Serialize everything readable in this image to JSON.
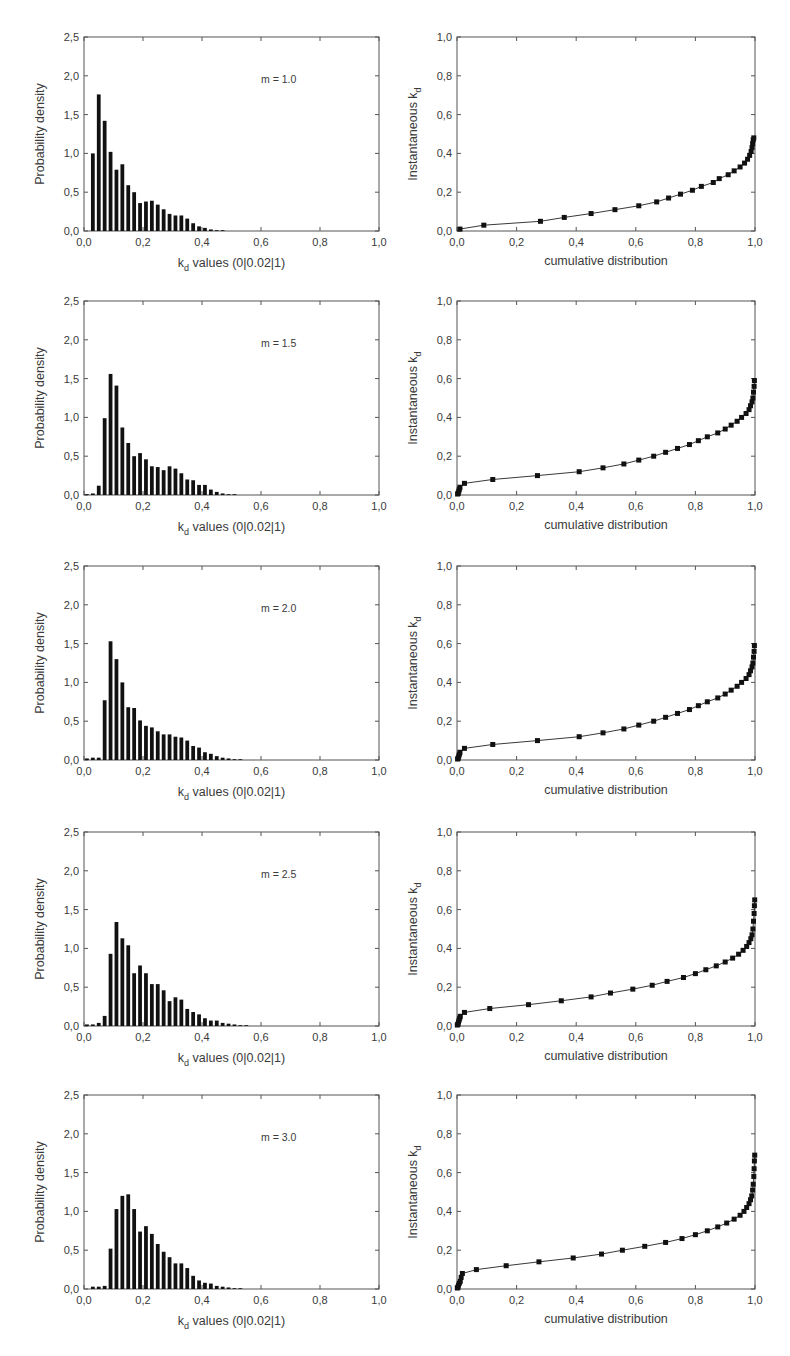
{
  "figure": {
    "left_ylabel": "Probability density",
    "left_xlabel_prefix": "k",
    "left_xlabel_sub": "d",
    "left_xlabel_suffix": "values (0|0.02|1)",
    "right_ylabel_prefix": "Instantaneous k",
    "right_ylabel_sub": "d",
    "right_xlabel": "cumulative distribution",
    "left_yticks": [
      "0,0",
      "0,5",
      "1,0",
      "1,5",
      "2,0",
      "2,5"
    ],
    "left_xticks": [
      "0,0",
      "0,2",
      "0,4",
      "0,6",
      "0,8",
      "1,0"
    ],
    "right_yticks": [
      "0,0",
      "0,2",
      "0,4",
      "0,6",
      "0,8",
      "1,0"
    ],
    "right_xticks": [
      "0,0",
      "0,2",
      "0,4",
      "0,6",
      "0,8",
      "1,0"
    ],
    "bar_color": "#111111",
    "frame_color": "#555555"
  },
  "chart_data": [
    {
      "type": "bar",
      "panel": "row1-left",
      "annotation": "m = 1.0",
      "xlabel": "k_d values (0|0.02|1)",
      "ylabel": "Probability density",
      "xlim": [
        0,
        1
      ],
      "ylim": [
        0,
        2.5
      ],
      "bin_width": 0.02,
      "bin_starts": [
        0.0,
        0.02,
        0.04,
        0.06,
        0.08,
        0.1,
        0.12,
        0.14,
        0.16,
        0.18,
        0.2,
        0.22,
        0.24,
        0.26,
        0.28,
        0.3,
        0.32,
        0.34,
        0.36,
        0.38,
        0.4,
        0.42,
        0.44,
        0.46
      ],
      "values": [
        0,
        1.0,
        1.76,
        1.42,
        1.02,
        0.79,
        0.86,
        0.59,
        0.5,
        0.36,
        0.38,
        0.39,
        0.34,
        0.28,
        0.22,
        0.2,
        0.2,
        0.16,
        0.1,
        0.06,
        0.04,
        0.02,
        0.01,
        0.005
      ]
    },
    {
      "type": "line",
      "panel": "row1-right",
      "xlabel": "cumulative distribution",
      "ylabel": "Instantaneous k_d",
      "xlim": [
        0,
        1
      ],
      "ylim": [
        0,
        1
      ],
      "markers": "square",
      "x": [
        0.01,
        0.09,
        0.28,
        0.36,
        0.45,
        0.53,
        0.61,
        0.67,
        0.71,
        0.75,
        0.79,
        0.82,
        0.86,
        0.88,
        0.91,
        0.93,
        0.95,
        0.965,
        0.975,
        0.982,
        0.987,
        0.99,
        0.992,
        0.994,
        0.996
      ],
      "y": [
        0.01,
        0.03,
        0.05,
        0.07,
        0.09,
        0.11,
        0.13,
        0.15,
        0.17,
        0.19,
        0.21,
        0.23,
        0.25,
        0.27,
        0.29,
        0.31,
        0.33,
        0.35,
        0.37,
        0.39,
        0.41,
        0.43,
        0.45,
        0.47,
        0.48
      ]
    },
    {
      "type": "bar",
      "panel": "row2-left",
      "annotation": "m = 1.5",
      "xlabel": "k_d values (0|0.02|1)",
      "ylabel": "Probability density",
      "xlim": [
        0,
        1
      ],
      "ylim": [
        0,
        2.5
      ],
      "bin_width": 0.02,
      "bin_starts": [
        0.0,
        0.02,
        0.04,
        0.06,
        0.08,
        0.1,
        0.12,
        0.14,
        0.16,
        0.18,
        0.2,
        0.22,
        0.24,
        0.26,
        0.28,
        0.3,
        0.32,
        0.34,
        0.36,
        0.38,
        0.4,
        0.42,
        0.44,
        0.46,
        0.48,
        0.5
      ],
      "values": [
        0.01,
        0.02,
        0.12,
        0.99,
        1.56,
        1.41,
        0.87,
        0.67,
        0.5,
        0.54,
        0.46,
        0.37,
        0.36,
        0.32,
        0.37,
        0.34,
        0.28,
        0.2,
        0.19,
        0.13,
        0.13,
        0.07,
        0.04,
        0.02,
        0.01,
        0.005
      ]
    },
    {
      "type": "line",
      "panel": "row2-right",
      "xlabel": "cumulative distribution",
      "ylabel": "Instantaneous k_d",
      "xlim": [
        0,
        1
      ],
      "ylim": [
        0,
        1
      ],
      "markers": "square",
      "x": [
        0.002,
        0.004,
        0.006,
        0.008,
        0.01,
        0.025,
        0.12,
        0.27,
        0.41,
        0.49,
        0.56,
        0.61,
        0.66,
        0.7,
        0.74,
        0.78,
        0.81,
        0.84,
        0.875,
        0.9,
        0.92,
        0.94,
        0.955,
        0.97,
        0.98,
        0.985,
        0.99,
        0.993,
        0.995,
        0.997,
        0.998
      ],
      "y": [
        0.005,
        0.01,
        0.02,
        0.03,
        0.04,
        0.06,
        0.08,
        0.1,
        0.12,
        0.14,
        0.16,
        0.18,
        0.2,
        0.22,
        0.24,
        0.26,
        0.28,
        0.3,
        0.32,
        0.34,
        0.36,
        0.38,
        0.4,
        0.42,
        0.44,
        0.46,
        0.48,
        0.5,
        0.53,
        0.56,
        0.59
      ]
    },
    {
      "type": "bar",
      "panel": "row3-left",
      "annotation": "m = 2.0",
      "xlabel": "k_d values (0|0.02|1)",
      "ylabel": "Probability density",
      "xlim": [
        0,
        1
      ],
      "ylim": [
        0,
        2.5
      ],
      "bin_width": 0.02,
      "bin_starts": [
        0.0,
        0.02,
        0.04,
        0.06,
        0.08,
        0.1,
        0.12,
        0.14,
        0.16,
        0.18,
        0.2,
        0.22,
        0.24,
        0.26,
        0.28,
        0.3,
        0.32,
        0.34,
        0.36,
        0.38,
        0.4,
        0.42,
        0.44,
        0.46,
        0.48,
        0.5,
        0.52
      ],
      "values": [
        0.02,
        0.03,
        0.03,
        0.77,
        1.53,
        1.3,
        1.0,
        0.68,
        0.67,
        0.51,
        0.44,
        0.42,
        0.37,
        0.33,
        0.33,
        0.3,
        0.29,
        0.25,
        0.18,
        0.16,
        0.1,
        0.08,
        0.05,
        0.03,
        0.02,
        0.01,
        0.005
      ]
    },
    {
      "type": "line",
      "panel": "row3-right",
      "xlabel": "cumulative distribution",
      "ylabel": "Instantaneous k_d",
      "xlim": [
        0,
        1
      ],
      "ylim": [
        0,
        1
      ],
      "markers": "square",
      "x": [
        0.002,
        0.004,
        0.006,
        0.008,
        0.01,
        0.025,
        0.12,
        0.27,
        0.41,
        0.49,
        0.56,
        0.61,
        0.66,
        0.7,
        0.74,
        0.78,
        0.81,
        0.84,
        0.875,
        0.9,
        0.92,
        0.94,
        0.955,
        0.97,
        0.98,
        0.985,
        0.99,
        0.993,
        0.995,
        0.997,
        0.998
      ],
      "y": [
        0.005,
        0.01,
        0.02,
        0.03,
        0.04,
        0.06,
        0.08,
        0.1,
        0.12,
        0.14,
        0.16,
        0.18,
        0.2,
        0.22,
        0.24,
        0.26,
        0.28,
        0.3,
        0.32,
        0.34,
        0.36,
        0.38,
        0.4,
        0.42,
        0.44,
        0.46,
        0.48,
        0.5,
        0.53,
        0.56,
        0.59
      ]
    },
    {
      "type": "bar",
      "panel": "row4-left",
      "annotation": "m = 2.5",
      "xlabel": "k_d values (0|0.02|1)",
      "ylabel": "Probability density",
      "xlim": [
        0,
        1
      ],
      "ylim": [
        0,
        2.5
      ],
      "bin_width": 0.02,
      "bin_starts": [
        0.0,
        0.02,
        0.04,
        0.06,
        0.08,
        0.1,
        0.12,
        0.14,
        0.16,
        0.18,
        0.2,
        0.22,
        0.24,
        0.26,
        0.28,
        0.3,
        0.32,
        0.34,
        0.36,
        0.38,
        0.4,
        0.42,
        0.44,
        0.46,
        0.48,
        0.5,
        0.52,
        0.54
      ],
      "values": [
        0.02,
        0.02,
        0.04,
        0.13,
        0.93,
        1.34,
        1.13,
        1.04,
        0.68,
        0.78,
        0.68,
        0.54,
        0.54,
        0.46,
        0.32,
        0.37,
        0.34,
        0.22,
        0.18,
        0.15,
        0.1,
        0.07,
        0.07,
        0.04,
        0.03,
        0.02,
        0.01,
        0.01
      ]
    },
    {
      "type": "line",
      "panel": "row4-right",
      "xlabel": "cumulative distribution",
      "ylabel": "Instantaneous k_d",
      "xlim": [
        0,
        1
      ],
      "ylim": [
        0,
        1
      ],
      "markers": "square",
      "x": [
        0.001,
        0.003,
        0.005,
        0.007,
        0.009,
        0.011,
        0.025,
        0.11,
        0.24,
        0.35,
        0.45,
        0.515,
        0.59,
        0.655,
        0.705,
        0.76,
        0.8,
        0.835,
        0.87,
        0.9,
        0.925,
        0.945,
        0.96,
        0.972,
        0.98,
        0.986,
        0.99,
        0.993,
        0.995,
        0.997,
        0.998,
        0.999
      ],
      "y": [
        0.005,
        0.01,
        0.02,
        0.03,
        0.04,
        0.05,
        0.07,
        0.09,
        0.11,
        0.13,
        0.15,
        0.17,
        0.19,
        0.21,
        0.23,
        0.25,
        0.27,
        0.29,
        0.31,
        0.33,
        0.35,
        0.37,
        0.39,
        0.41,
        0.43,
        0.45,
        0.47,
        0.5,
        0.54,
        0.58,
        0.62,
        0.65
      ]
    },
    {
      "type": "bar",
      "panel": "row5-left",
      "annotation": "m = 3.0",
      "xlabel": "k_d values (0|0.02|1)",
      "ylabel": "Probability density",
      "xlim": [
        0,
        1
      ],
      "ylim": [
        0,
        2.5
      ],
      "bin_width": 0.02,
      "bin_starts": [
        0.0,
        0.02,
        0.04,
        0.06,
        0.08,
        0.1,
        0.12,
        0.14,
        0.16,
        0.18,
        0.2,
        0.22,
        0.24,
        0.26,
        0.28,
        0.3,
        0.32,
        0.34,
        0.36,
        0.38,
        0.4,
        0.42,
        0.44,
        0.46,
        0.48,
        0.5,
        0.52
      ],
      "values": [
        0.0,
        0.03,
        0.03,
        0.04,
        0.52,
        1.03,
        1.2,
        1.22,
        1.03,
        0.74,
        0.81,
        0.71,
        0.58,
        0.48,
        0.41,
        0.33,
        0.33,
        0.27,
        0.17,
        0.11,
        0.08,
        0.07,
        0.04,
        0.03,
        0.02,
        0.01,
        0.005
      ]
    },
    {
      "type": "line",
      "panel": "row5-right",
      "xlabel": "cumulative distribution",
      "ylabel": "Instantaneous k_d",
      "xlim": [
        0,
        1
      ],
      "ylim": [
        0,
        1
      ],
      "markers": "square",
      "x": [
        0.001,
        0.003,
        0.005,
        0.008,
        0.011,
        0.014,
        0.018,
        0.065,
        0.165,
        0.275,
        0.39,
        0.485,
        0.555,
        0.63,
        0.7,
        0.755,
        0.8,
        0.84,
        0.875,
        0.905,
        0.93,
        0.95,
        0.963,
        0.972,
        0.98,
        0.985,
        0.989,
        0.992,
        0.994,
        0.996,
        0.997,
        0.998,
        0.999
      ],
      "y": [
        0.005,
        0.01,
        0.02,
        0.03,
        0.04,
        0.06,
        0.08,
        0.1,
        0.12,
        0.14,
        0.16,
        0.18,
        0.2,
        0.22,
        0.24,
        0.26,
        0.28,
        0.3,
        0.32,
        0.34,
        0.36,
        0.38,
        0.4,
        0.42,
        0.44,
        0.46,
        0.48,
        0.51,
        0.54,
        0.58,
        0.62,
        0.66,
        0.69
      ]
    }
  ]
}
